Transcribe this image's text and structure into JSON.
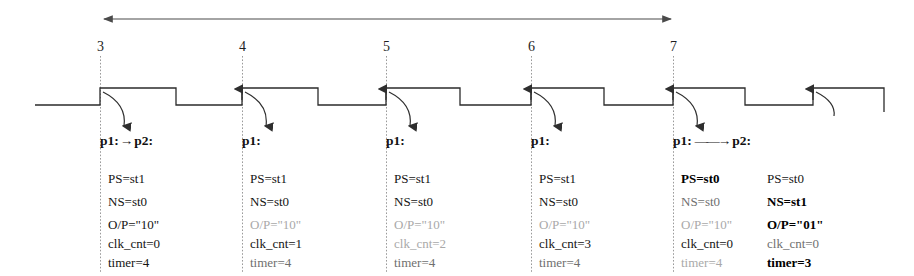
{
  "figure": {
    "type": "timing-diagram",
    "span_arrow": {
      "label": "",
      "from_clock": "3",
      "to_clock": "7"
    }
  },
  "clock_labels": [
    {
      "text": "3",
      "x": 97
    },
    {
      "text": "4",
      "x": 239
    },
    {
      "text": "5",
      "x": 383
    },
    {
      "text": "6",
      "x": 528
    },
    {
      "text": "7",
      "x": 670
    }
  ],
  "annotations": [
    {
      "id": "grp-3",
      "x": 100,
      "head": {
        "left": "p1:",
        "arrow": "short",
        "right": "p2:"
      },
      "columns": [
        {
          "name": "p1",
          "rows": [
            {
              "text": "PS=st1",
              "tone": "dark"
            },
            {
              "text": "NS=st0",
              "tone": "dark"
            },
            {
              "text": "O/P=\"10\"",
              "tone": "dark"
            },
            {
              "text": "clk_cnt=0",
              "tone": "dark"
            },
            {
              "text": "timer=4",
              "tone": "dark"
            }
          ]
        }
      ]
    },
    {
      "id": "grp-4",
      "x": 242,
      "head": {
        "left": "p1:",
        "arrow": "none",
        "right": ""
      },
      "columns": [
        {
          "name": "p1",
          "rows": [
            {
              "text": "PS=st1",
              "tone": "dark"
            },
            {
              "text": "NS=st0",
              "tone": "dark"
            },
            {
              "text": "O/P=\"10\"",
              "tone": "faint"
            },
            {
              "text": "clk_cnt=1",
              "tone": "dark"
            },
            {
              "text": "timer=4",
              "tone": "mid"
            }
          ]
        }
      ]
    },
    {
      "id": "grp-5",
      "x": 386,
      "head": {
        "left": "p1:",
        "arrow": "none",
        "right": ""
      },
      "columns": [
        {
          "name": "p1",
          "rows": [
            {
              "text": "PS=st1",
              "tone": "dark"
            },
            {
              "text": "NS=st0",
              "tone": "dark"
            },
            {
              "text": "O/P=\"10\"",
              "tone": "faint"
            },
            {
              "text": "clk_cnt=2",
              "tone": "faint"
            },
            {
              "text": "timer=4",
              "tone": "mid"
            }
          ]
        }
      ]
    },
    {
      "id": "grp-6",
      "x": 531,
      "head": {
        "left": "p1:",
        "arrow": "none",
        "right": ""
      },
      "columns": [
        {
          "name": "p1",
          "rows": [
            {
              "text": "PS=st1",
              "tone": "dark"
            },
            {
              "text": "NS=st0",
              "tone": "dark"
            },
            {
              "text": "O/P=\"10\"",
              "tone": "faint"
            },
            {
              "text": "clk_cnt=3",
              "tone": "dark"
            },
            {
              "text": "timer=4",
              "tone": "mid"
            }
          ]
        }
      ]
    },
    {
      "id": "grp-7",
      "x": 673,
      "head": {
        "left": "p1:",
        "arrow": "long",
        "right": "p2:"
      },
      "columns": [
        {
          "name": "p1",
          "rows": [
            {
              "text": "PS=st0",
              "tone": "bold"
            },
            {
              "text": "NS=st0",
              "tone": "mid"
            },
            {
              "text": "O/P=\"10\"",
              "tone": "faint"
            },
            {
              "text": "clk_cnt=0",
              "tone": "dark"
            },
            {
              "text": "timer=4",
              "tone": "faint"
            }
          ]
        },
        {
          "name": "p2",
          "rows": [
            {
              "text": "PS=st0",
              "tone": "dark"
            },
            {
              "text": "NS=st1",
              "tone": "bold"
            },
            {
              "text": "O/P=\"01\"",
              "tone": "bold"
            },
            {
              "text": "clk_cnt=0",
              "tone": "mid"
            },
            {
              "text": "timer=3",
              "tone": "bold"
            }
          ]
        }
      ]
    }
  ],
  "colors": {
    "ink": "#1b1b1b",
    "guide": "#9a9a9a",
    "faint_text": "#a9a9a9",
    "mid_text": "#6f6f6f"
  }
}
